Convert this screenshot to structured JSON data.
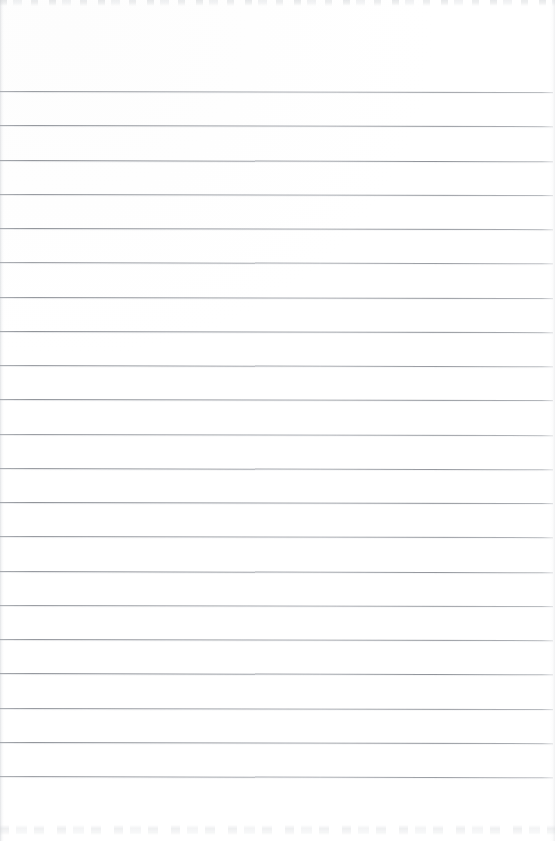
{
  "document": {
    "kind": "scanned-lined-notebook-page",
    "title": "",
    "visible_text": "",
    "page_width": 555,
    "page_height": 841,
    "paper_color": "#ffffff",
    "rule_color": "#888c93",
    "scan_edge_color": "#cbced2"
  },
  "ruling": {
    "line_count": 21,
    "first_line_y": 91,
    "line_spacing": 34.25,
    "line_thickness": 1,
    "line_start_x": 0,
    "line_end_x": 553,
    "slant_deg": 0.12,
    "top_margin": 91,
    "bottom_margin": 65,
    "line_y_positions": [
      91,
      125.3,
      159.5,
      193.8,
      228,
      262.3,
      296.5,
      330.8,
      365,
      399.3,
      433.5,
      467.8,
      502,
      536.3,
      570.5,
      604.8,
      639,
      673.3,
      707.5,
      741.8,
      776
    ]
  },
  "artifacts": {
    "top_band": {
      "y": 0,
      "height": 6
    },
    "bottom_band": {
      "y": 825,
      "height": 10
    },
    "left_edge_shade_width": 4,
    "right_edge_shade_width": 5
  }
}
